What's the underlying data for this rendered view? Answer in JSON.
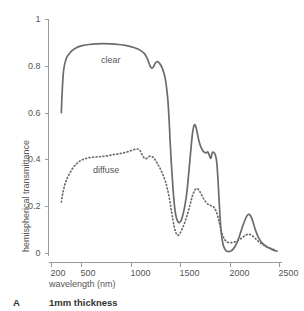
{
  "chart_data": {
    "type": "line",
    "title": "",
    "xlabel": "wavelength (nm)",
    "ylabel": "hemispherical transmittance",
    "xlim": [
      170,
      2530
    ],
    "ylim": [
      0,
      1
    ],
    "grid": false,
    "legend_position": "inline-annotations",
    "xticks": [
      "200",
      "500",
      "1000",
      "1500",
      "2000",
      "2500"
    ],
    "xtick_values": [
      200,
      500,
      1000,
      1500,
      2000,
      2500
    ],
    "yticks": [
      "0",
      "0.2",
      "0.4",
      "0.6",
      "0.8",
      "1"
    ],
    "ytick_values": [
      0,
      0.2,
      0.4,
      0.6,
      0.8,
      1
    ],
    "annotations": [
      {
        "text": "clear",
        "x": 700,
        "y": 0.82
      },
      {
        "text": "diffuse",
        "x": 620,
        "y": 0.35
      }
    ],
    "series": [
      {
        "name": "clear",
        "style": "solid",
        "color": "#6b6b6b",
        "x": [
          300,
          305,
          312,
          320,
          330,
          345,
          360,
          380,
          400,
          430,
          470,
          520,
          580,
          650,
          720,
          800,
          880,
          960,
          1040,
          1100,
          1140,
          1170,
          1190,
          1210,
          1230,
          1250,
          1270,
          1290,
          1320,
          1350,
          1375,
          1390,
          1400,
          1415,
          1430,
          1445,
          1460,
          1480,
          1500,
          1520,
          1545,
          1570,
          1600,
          1625,
          1645,
          1665,
          1690,
          1715,
          1740,
          1765,
          1780,
          1795,
          1810,
          1825,
          1840,
          1855,
          1870,
          1885,
          1900,
          1915,
          1935,
          1960,
          1990,
          2020,
          2055,
          2090,
          2125,
          2155,
          2185,
          2210,
          2235,
          2260,
          2290,
          2325,
          2365,
          2405,
          2445,
          2480
        ],
        "y": [
          0.6,
          0.66,
          0.72,
          0.77,
          0.8,
          0.825,
          0.84,
          0.852,
          0.862,
          0.872,
          0.881,
          0.887,
          0.891,
          0.894,
          0.895,
          0.894,
          0.891,
          0.886,
          0.877,
          0.866,
          0.852,
          0.83,
          0.806,
          0.791,
          0.795,
          0.812,
          0.818,
          0.812,
          0.79,
          0.745,
          0.66,
          0.56,
          0.47,
          0.36,
          0.265,
          0.195,
          0.155,
          0.133,
          0.132,
          0.15,
          0.195,
          0.265,
          0.4,
          0.51,
          0.548,
          0.53,
          0.48,
          0.448,
          0.432,
          0.428,
          0.432,
          0.418,
          0.405,
          0.428,
          0.43,
          0.42,
          0.39,
          0.3,
          0.18,
          0.09,
          0.035,
          0.012,
          0.006,
          0.01,
          0.028,
          0.06,
          0.105,
          0.14,
          0.164,
          0.16,
          0.135,
          0.1,
          0.068,
          0.045,
          0.03,
          0.02,
          0.012,
          0.008
        ]
      },
      {
        "name": "diffuse",
        "style": "dotted",
        "color": "#6b6b6b",
        "x": [
          300,
          308,
          318,
          330,
          345,
          365,
          390,
          420,
          455,
          495,
          540,
          590,
          645,
          700,
          760,
          820,
          880,
          940,
          1000,
          1045,
          1075,
          1095,
          1110,
          1130,
          1150,
          1170,
          1185,
          1200,
          1215,
          1230,
          1245,
          1265,
          1290,
          1320,
          1350,
          1375,
          1395,
          1412,
          1428,
          1442,
          1455,
          1468,
          1482,
          1498,
          1515,
          1540,
          1570,
          1600,
          1625,
          1650,
          1675,
          1700,
          1730,
          1760,
          1790,
          1815,
          1840,
          1865,
          1885,
          1905,
          1925,
          1950,
          1980,
          2015,
          2055,
          2095,
          2135,
          2170,
          2200,
          2230,
          2260,
          2295,
          2335,
          2380,
          2425,
          2470
        ],
        "y": [
          0.218,
          0.24,
          0.262,
          0.284,
          0.305,
          0.325,
          0.345,
          0.365,
          0.382,
          0.395,
          0.403,
          0.408,
          0.41,
          0.412,
          0.415,
          0.42,
          0.424,
          0.429,
          0.437,
          0.443,
          0.444,
          0.438,
          0.425,
          0.41,
          0.403,
          0.406,
          0.412,
          0.414,
          0.412,
          0.408,
          0.4,
          0.386,
          0.368,
          0.342,
          0.308,
          0.268,
          0.225,
          0.18,
          0.14,
          0.11,
          0.09,
          0.078,
          0.076,
          0.083,
          0.098,
          0.122,
          0.16,
          0.205,
          0.245,
          0.27,
          0.275,
          0.262,
          0.238,
          0.218,
          0.206,
          0.202,
          0.196,
          0.178,
          0.15,
          0.115,
          0.082,
          0.058,
          0.046,
          0.044,
          0.048,
          0.056,
          0.068,
          0.078,
          0.08,
          0.074,
          0.062,
          0.048,
          0.036,
          0.026,
          0.018,
          0.012
        ]
      }
    ]
  },
  "caption": {
    "letter": "A",
    "text": "1mm thickness"
  }
}
